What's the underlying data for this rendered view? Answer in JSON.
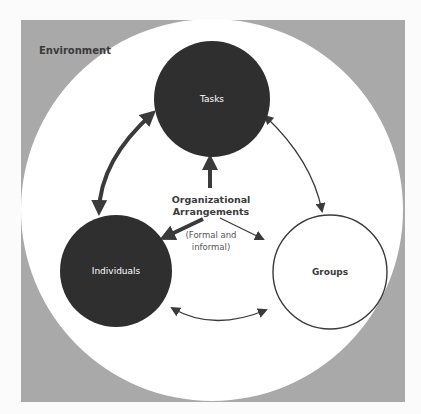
{
  "diagram": {
    "environment_label": "Environment",
    "nodes": {
      "tasks": "Tasks",
      "individuals": "Individuals",
      "groups": "Groups"
    },
    "center": {
      "line1": "Organizational",
      "line2": "Arrangements",
      "sub1": "(Formal and",
      "sub2": "informal)"
    },
    "colors": {
      "background": "#fbfbfb",
      "environment": "#a9a9a9",
      "inner_circle": "#ffffff",
      "dark_node": "#2f2f2f",
      "arrow": "#3a3a3a"
    }
  }
}
